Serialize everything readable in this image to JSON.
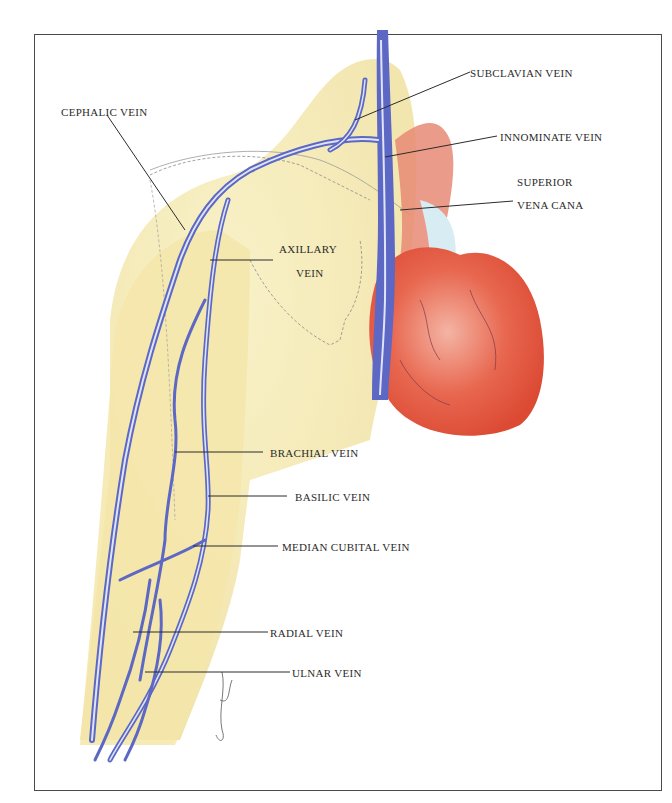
{
  "diagram": {
    "colors": {
      "skin": "#f6ecb4",
      "skin_shadow": "#eedc95",
      "vein": "#5c68c4",
      "vein_highlight": "#dfe4f8",
      "heart": "#e4553f",
      "heart_light": "#f2a595",
      "aorta_light": "#d8ecf4",
      "leader_line": "#2b2b2b",
      "frame": "#4a4a4a"
    },
    "labels": {
      "subclavian": "SUBCLAVIAN VEIN",
      "cephalic": "CEPHALIC VEIN",
      "innominate": "INNOMINATE VEIN",
      "svc_line1": "SUPERIOR",
      "svc_line2": "VENA CANA",
      "axillary_line1": "AXILLARY",
      "axillary_line2": "VEIN",
      "brachial": "BRACHIAL VEIN",
      "basilic": "BASILIC VEIN",
      "median_cubital": "MEDIAN CUBITAL VEIN",
      "radial": "RADIAL VEIN",
      "ulnar": "ULNAR VEIN"
    },
    "structures": [
      "arm",
      "shoulder",
      "scapula-outline",
      "heart",
      "aorta",
      "superior-vena-cava",
      "artist-signature"
    ]
  }
}
